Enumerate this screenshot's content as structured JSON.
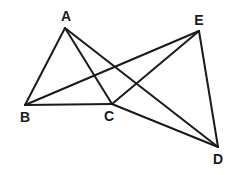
{
  "diagram": {
    "type": "geometry-figure",
    "stroke_color": "#1a1a1a",
    "background": "#ffffff",
    "points": [
      {
        "id": "A",
        "label": "A",
        "x": 65,
        "y": 28,
        "lx": 66,
        "ly": 21
      },
      {
        "id": "B",
        "label": "B",
        "x": 25,
        "y": 105,
        "lx": 25,
        "ly": 122
      },
      {
        "id": "C",
        "label": "C",
        "x": 112,
        "y": 104,
        "lx": 109,
        "ly": 121
      },
      {
        "id": "D",
        "label": "D",
        "x": 218,
        "y": 147,
        "lx": 218,
        "ly": 164
      },
      {
        "id": "E",
        "label": "E",
        "x": 199,
        "y": 31,
        "lx": 199,
        "ly": 25
      }
    ],
    "edges": [
      {
        "from": "A",
        "to": "B"
      },
      {
        "from": "A",
        "to": "C"
      },
      {
        "from": "A",
        "to": "D"
      },
      {
        "from": "B",
        "to": "C"
      },
      {
        "from": "B",
        "to": "E"
      },
      {
        "from": "C",
        "to": "E"
      },
      {
        "from": "C",
        "to": "D"
      },
      {
        "from": "E",
        "to": "D"
      }
    ]
  }
}
